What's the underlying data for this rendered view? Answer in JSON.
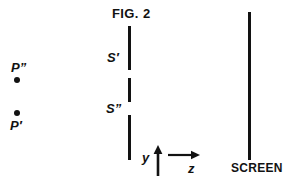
{
  "figure": {
    "title": "FIG. 2",
    "caption_color": "#121212",
    "background_color": "#ffffff",
    "stroke_color": "#121212"
  },
  "sources": [
    {
      "name": "upper-source-point",
      "label": "P”",
      "label_position": "above",
      "x": 17,
      "y": 80
    },
    {
      "name": "lower-source-point",
      "label": "P′",
      "label_position": "below",
      "x": 17,
      "y": 113
    }
  ],
  "barrier": {
    "name": "double-slit-barrier",
    "x": 129,
    "segments": [
      {
        "name": "barrier-segment-top",
        "y_start": 26,
        "y_end": 70
      },
      {
        "name": "barrier-segment-middle",
        "y_start": 78,
        "y_end": 102
      },
      {
        "name": "barrier-segment-bottom",
        "y_start": 115,
        "y_end": 160
      }
    ],
    "slits": [
      {
        "name": "slit-upper",
        "label": "S′",
        "y_start": 70,
        "y_end": 78
      },
      {
        "name": "slit-lower",
        "label": "S”",
        "y_start": 102,
        "y_end": 115
      }
    ]
  },
  "screen": {
    "label": "SCREEN",
    "x": 249,
    "y_start": 12,
    "y_end": 160
  },
  "axes": {
    "vertical": {
      "label": "y",
      "direction": "up"
    },
    "horizontal": {
      "label": "z",
      "direction": "right"
    },
    "origin_x": 158,
    "origin_y": 177
  }
}
